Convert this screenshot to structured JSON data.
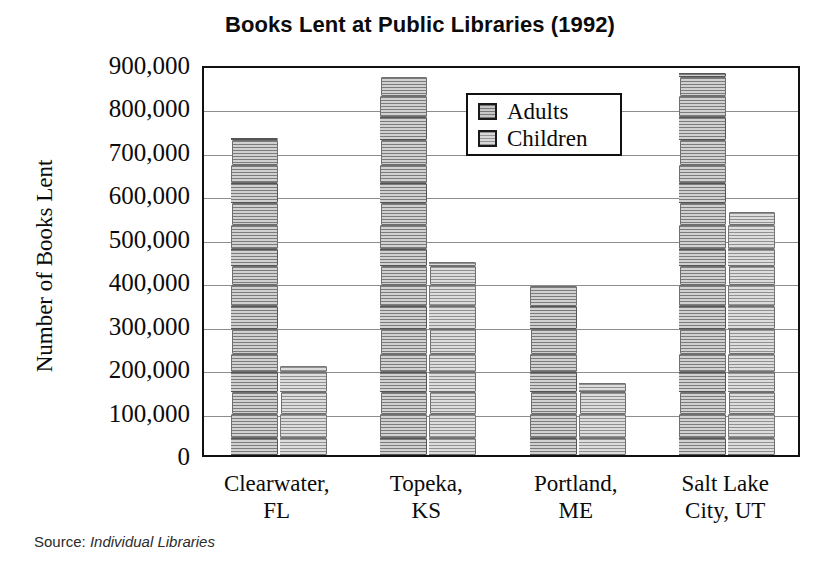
{
  "chart_data": {
    "type": "bar",
    "title": "Books Lent at Public Libraries (1992)",
    "xlabel": "",
    "ylabel": "Number of Books Lent",
    "ylim": [
      0,
      900000
    ],
    "ytick_values": [
      900000,
      800000,
      700000,
      600000,
      500000,
      400000,
      300000,
      200000,
      100000,
      0
    ],
    "ytick_labels": [
      "900,000",
      "800,000",
      "700,000",
      "600,000",
      "500,000",
      "400,000",
      "300,000",
      "200,000",
      "100,000",
      "0"
    ],
    "grid": true,
    "legend_position": "upper-center",
    "categories": [
      "Clearwater, FL",
      "Topeka, KS",
      "Portland, ME",
      "Salt Lake City, UT"
    ],
    "category_lines": [
      [
        "Clearwater,",
        "FL"
      ],
      [
        "Topeka,",
        "KS"
      ],
      [
        "Portland,",
        "ME"
      ],
      [
        "Salt Lake",
        "City, UT"
      ]
    ],
    "series": [
      {
        "name": "Adults",
        "color": "#9a9a9a",
        "values": [
          730000,
          870000,
          390000,
          880000
        ]
      },
      {
        "name": "Children",
        "color": "#b4b4b4",
        "values": [
          205000,
          445000,
          165000,
          560000
        ]
      }
    ],
    "source_prefix": "Source:",
    "source_name": "Individual Libraries"
  },
  "legend": {
    "items": [
      {
        "label": "Adults"
      },
      {
        "label": "Children"
      }
    ]
  },
  "colors": {
    "adults": "#9a9a9a",
    "children": "#b4b4b4",
    "axis": "#111111",
    "grid": "#8d8d8d",
    "background": "#ffffff"
  }
}
